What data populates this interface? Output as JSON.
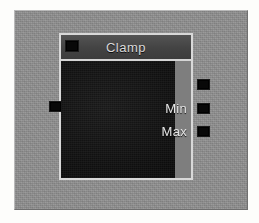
{
  "canvas": {
    "background_color": "#8d8d8d",
    "frame_color": "#fdfdfb"
  },
  "node": {
    "title": "Clamp",
    "title_bar_color": "#474747",
    "body_color": "#151515",
    "border_color": "#d8d8d8",
    "header_socket": {
      "name": "node-header-socket",
      "color": "#080808"
    },
    "inputs": [
      {
        "label": "",
        "socket_name": "input-socket-value",
        "color": "#080808"
      }
    ],
    "outputs": [
      {
        "label": "",
        "socket_name": "output-socket-result",
        "color": "#080808"
      },
      {
        "label": "Min",
        "socket_name": "output-socket-min",
        "color": "#080808"
      },
      {
        "label": "Max",
        "socket_name": "output-socket-max",
        "color": "#080808"
      }
    ]
  }
}
